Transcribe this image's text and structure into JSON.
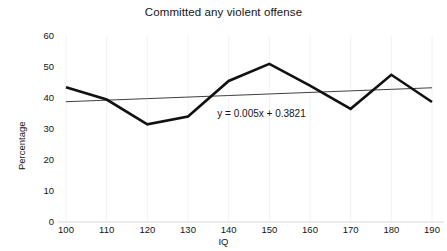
{
  "chart_data": {
    "type": "line",
    "title": "Committed any violent offense",
    "xlabel": "IQ",
    "ylabel": "Percentage",
    "x": [
      100,
      110,
      120,
      130,
      140,
      150,
      160,
      170,
      180,
      190
    ],
    "categories": [
      "100",
      "110",
      "120",
      "130",
      "140",
      "150",
      "160",
      "170",
      "180",
      "190"
    ],
    "series": [
      {
        "name": "Committed any violent offense",
        "values": [
          43.5,
          39.5,
          31.5,
          34.0,
          45.5,
          51.0,
          44.0,
          36.5,
          47.5,
          38.7
        ],
        "color": "#111111",
        "style": "solid",
        "width": 2.6
      },
      {
        "name": "Linear trendline",
        "values": [
          38.8,
          39.3,
          39.8,
          40.3,
          40.8,
          41.3,
          41.8,
          42.3,
          42.8,
          43.3
        ],
        "color": "#404040",
        "style": "solid",
        "width": 1.0
      }
    ],
    "annotations": [
      {
        "name": "trendline-equation",
        "text": "y = 0.005x + 0.3821",
        "x": 150,
        "y": 40.0
      }
    ],
    "xlim": [
      100,
      190
    ],
    "ylim": [
      0,
      60
    ],
    "xticks": [
      100,
      110,
      120,
      130,
      140,
      150,
      160,
      170,
      180,
      190
    ],
    "yticks": [
      0,
      10,
      20,
      30,
      40,
      50,
      60
    ],
    "ytick_labels": [
      "0",
      "10",
      "20",
      "30",
      "40",
      "50",
      "60"
    ],
    "grid": {
      "vertical": true,
      "horizontal": false,
      "color": "#f2f2f2"
    },
    "legend": {
      "visible": false,
      "position": "none"
    },
    "background": "#ffffff",
    "axis_color": "#d9d9d9"
  }
}
